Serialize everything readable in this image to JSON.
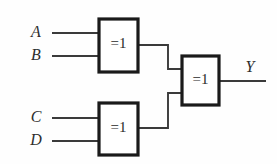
{
  "figure": {
    "name": "four-input-xor-tree",
    "background_color": "#fefefe",
    "wire_color": "#3a3a3a",
    "gate_border_color": "#1a1a1a",
    "gate_fill_color": "#ffffff",
    "label_color": "#2e2e2e"
  },
  "inputs": [
    {
      "label": "A",
      "label_x": 36,
      "label_y": 33,
      "wire_x1": 52,
      "wire_y": 33,
      "wire_x2": 99
    },
    {
      "label": "B",
      "label_x": 36,
      "label_y": 56,
      "wire_x1": 52,
      "wire_y": 56,
      "wire_x2": 99
    },
    {
      "label": "C",
      "label_x": 36,
      "label_y": 118,
      "wire_x1": 52,
      "wire_y": 118,
      "wire_x2": 99
    },
    {
      "label": "D",
      "label_x": 36,
      "label_y": 141,
      "wire_x1": 52,
      "wire_y": 141,
      "wire_x2": 99
    }
  ],
  "gates": [
    {
      "id": "gate-xor-ab",
      "symbol": "=1",
      "x": 99,
      "y": 19,
      "width": 39,
      "height": 53,
      "label_x": 118.5,
      "label_y": 44
    },
    {
      "id": "gate-xor-cd",
      "symbol": "=1",
      "x": 99,
      "y": 103,
      "width": 39,
      "height": 52,
      "label_x": 118.5,
      "label_y": 128
    },
    {
      "id": "gate-xor-out",
      "symbol": "=1",
      "x": 182,
      "y": 56,
      "width": 37,
      "height": 49,
      "label_x": 200.5,
      "label_y": 80
    }
  ],
  "connections": [
    {
      "id": "wire-gate-ab-to-out",
      "path": "M 138 45 L 168 45 L 168 69 L 182 69"
    },
    {
      "id": "wire-gate-cd-to-out",
      "path": "M 138 128 L 168 128 L 168 93 L 182 93"
    }
  ],
  "outputs": [
    {
      "label": "Y",
      "label_x": 250,
      "label_y": 68,
      "wire_x1": 219,
      "wire_y": 81,
      "wire_x2": 266
    }
  ]
}
